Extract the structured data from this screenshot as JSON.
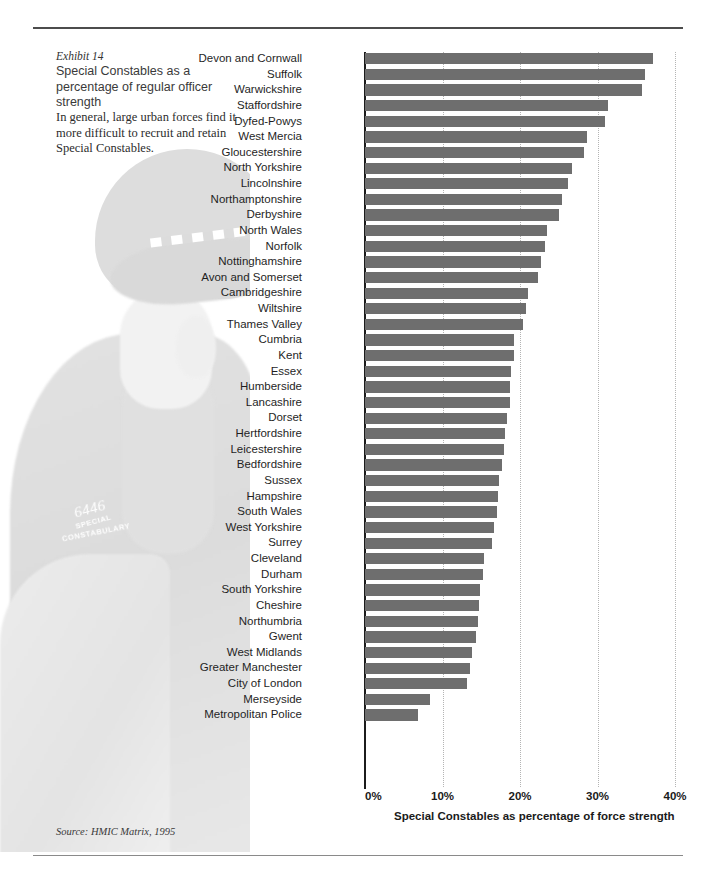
{
  "exhibit": {
    "number": "Exhibit 14",
    "title": "Special Constables as a percentage of regular officer strength",
    "body": "In general, large urban forces find it more difficult to recruit and retain Special Constables.",
    "source": "Source: HMIC Matrix, 1995"
  },
  "watermark": {
    "patch_number": "6446",
    "patch_line1": "SPECIAL",
    "patch_line2": "CONSTABULARY"
  },
  "colors": {
    "bar": "#6e6e6e",
    "axis": "#1c1c1c",
    "grid": "#b4b4b4",
    "rule": "#4c4c4c"
  },
  "chart_data": {
    "type": "bar",
    "orientation": "horizontal",
    "title": "Special Constables as a percentage of regular officer strength",
    "xlabel": "Special Constables as percentage of force strength",
    "ylabel": "",
    "xlim": [
      0,
      40
    ],
    "xticks": [
      0,
      10,
      20,
      30,
      40
    ],
    "xtick_labels": [
      "0%",
      "10%",
      "20%",
      "30%",
      "40%"
    ],
    "grid": true,
    "legend": false,
    "unit": "%",
    "categories": [
      "Devon and Cornwall",
      "Suffolk",
      "Warwickshire",
      "Staffordshire",
      "Dyfed-Powys",
      "West Mercia",
      "Gloucestershire",
      "North Yorkshire",
      "Lincolnshire",
      "Northamptonshire",
      "Derbyshire",
      "North Wales",
      "Norfolk",
      "Nottinghamshire",
      "Avon and Somerset",
      "Cambridgeshire",
      "Wiltshire",
      "Thames Valley",
      "Cumbria",
      "Kent",
      "Essex",
      "Humberside",
      "Lancashire",
      "Dorset",
      "Hertfordshire",
      "Leicestershire",
      "Bedfordshire",
      "Sussex",
      "Hampshire",
      "South Wales",
      "West Yorkshire",
      "Surrey",
      "Cleveland",
      "Durham",
      "South Yorkshire",
      "Cheshire",
      "Northumbria",
      "Gwent",
      "West Midlands",
      "Greater Manchester",
      "City of London",
      "Merseyside",
      "Metropolitan Police"
    ],
    "values": [
      37.2,
      36.1,
      35.8,
      31.3,
      31.0,
      28.7,
      28.2,
      26.7,
      26.2,
      25.4,
      25.0,
      23.5,
      23.2,
      22.7,
      22.3,
      21.0,
      20.8,
      20.4,
      19.2,
      19.2,
      18.9,
      18.7,
      18.7,
      18.3,
      18.0,
      17.9,
      17.7,
      17.3,
      17.2,
      17.0,
      16.6,
      16.4,
      15.4,
      15.2,
      14.8,
      14.7,
      14.6,
      14.3,
      13.8,
      13.5,
      13.2,
      8.4,
      6.8
    ]
  }
}
